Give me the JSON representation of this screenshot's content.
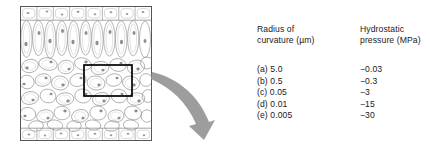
{
  "diagram": {
    "name": "leaf-cross-section",
    "border_color": "#4a4a4a",
    "cell_outline_color": "#8a8a8a",
    "highlight_box_color": "#000000",
    "arrow_color": "#9a9a9a",
    "layers": [
      {
        "name": "upper-epidermis",
        "cells": 8
      },
      {
        "name": "palisade-mesophyll",
        "cells": 10
      },
      {
        "name": "spongy-mesophyll",
        "cells": 34
      },
      {
        "name": "lower-epidermis",
        "cells": 8
      }
    ]
  },
  "table": {
    "headers": {
      "radius": "Radius of\ncurvature (µm)",
      "pressure": "Hydrostatic\npressure (MPa)"
    },
    "rows": [
      {
        "label": "(a) 5.0",
        "pressure": "−0.03"
      },
      {
        "label": "(b) 0.5",
        "pressure": "−0.3"
      },
      {
        "label": "(c) 0.05",
        "pressure": "−3"
      },
      {
        "label": "(d) 0.01",
        "pressure": "−15"
      },
      {
        "label": "(e) 0.005",
        "pressure": "−30"
      }
    ]
  }
}
